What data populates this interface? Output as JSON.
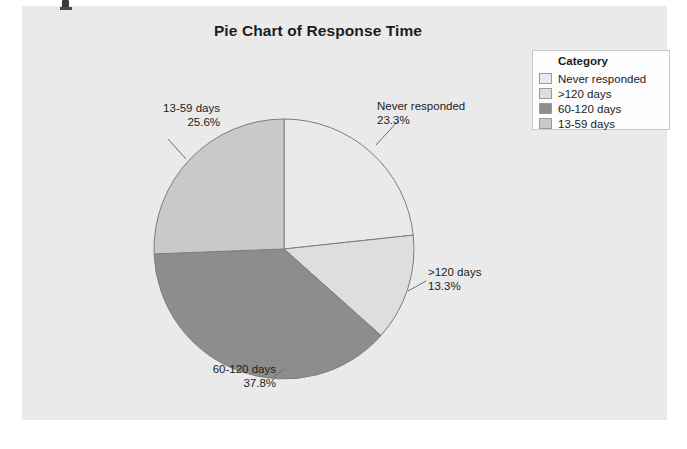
{
  "page": {
    "background_color": "#ededed",
    "panel_color": "#ededed"
  },
  "chart_data": {
    "type": "pie",
    "title": "Pie Chart of Response Time",
    "legend_title": "Category",
    "legend_position": "right",
    "start_angle_deg": 0,
    "direction": "clockwise",
    "categories": [
      "Never responded",
      ">120 days",
      "60-120 days",
      "13-59 days"
    ],
    "values": [
      23.3,
      13.3,
      37.8,
      25.6
    ],
    "value_unit": "%",
    "colors": [
      "#e9e9e9",
      "#dedede",
      "#8d8d8d",
      "#c9c9c9"
    ],
    "slice_border_color": "#7d7d7d",
    "labels": [
      {
        "name": "Never responded",
        "percent": "23.3%"
      },
      {
        "name": ">120 days",
        "percent": "13.3%"
      },
      {
        "name": "60-120 days",
        "percent": "37.8%"
      },
      {
        "name": "13-59 days",
        "percent": "25.6%"
      }
    ],
    "xlabel": "",
    "ylabel": ""
  },
  "legend": {
    "title": "Category",
    "items": [
      {
        "label": "Never responded",
        "color": "#e9e9e9"
      },
      {
        "label": ">120 days",
        "color": "#dedede"
      },
      {
        "label": "60-120 days",
        "color": "#8d8d8d"
      },
      {
        "label": "13-59 days",
        "color": "#c9c9c9"
      }
    ]
  }
}
